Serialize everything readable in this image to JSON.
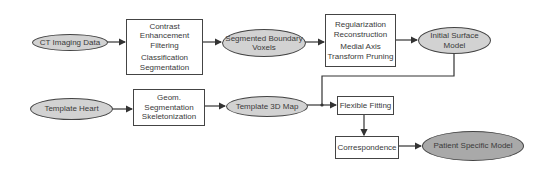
{
  "diagram": {
    "nodes": {
      "ct_imaging": {
        "label": "CT Imaging Data",
        "shape": "ellipse"
      },
      "preprocess": {
        "lines": [
          "Contrast",
          "Enhancement",
          "Filtering",
          "Classification",
          "Segmentation"
        ],
        "shape": "box"
      },
      "seg_voxels": {
        "lines": [
          "Segmented Boundary",
          "Voxels"
        ],
        "shape": "ellipse"
      },
      "reconstruct": {
        "lines": [
          "Regularization",
          "Reconstruction",
          "Medial Axis",
          "Transform Pruning"
        ],
        "shape": "box"
      },
      "initial_surface": {
        "lines": [
          "Initial Surface",
          "Model"
        ],
        "shape": "ellipse"
      },
      "template_heart": {
        "label": "Template Heart",
        "shape": "ellipse"
      },
      "geom": {
        "lines": [
          "Geom.",
          "Segmentation",
          "Skeletonization"
        ],
        "shape": "box"
      },
      "template_map": {
        "label": "Template 3D Map",
        "shape": "ellipse"
      },
      "flexible_fitting": {
        "label": "Flexible Fitting",
        "shape": "box"
      },
      "correspondence": {
        "label": "Correspondence",
        "shape": "box"
      },
      "patient_model": {
        "label": "Patient Specific Model",
        "shape": "ellipse-dark"
      }
    },
    "edges": [
      [
        "CT Imaging Data",
        "Contrast Enhancement Filtering / Classification Segmentation"
      ],
      [
        "Contrast Enhancement Filtering / Classification Segmentation",
        "Segmented Boundary Voxels"
      ],
      [
        "Segmented Boundary Voxels",
        "Regularization Reconstruction / Medial Axis Transform Pruning"
      ],
      [
        "Regularization Reconstruction / Medial Axis Transform Pruning",
        "Initial Surface Model"
      ],
      [
        "Initial Surface Model",
        "Flexible Fitting"
      ],
      [
        "Template Heart",
        "Geom. Segmentation Skeletonization"
      ],
      [
        "Geom. Segmentation Skeletonization",
        "Template 3D Map"
      ],
      [
        "Template 3D Map",
        "Flexible Fitting"
      ],
      [
        "Flexible Fitting",
        "Correspondence"
      ],
      [
        "Correspondence",
        "Patient Specific Model"
      ]
    ],
    "colors": {
      "ellipse_fill": "#d2d2d2",
      "ellipse_dark_fill": "#a9a9a9",
      "stroke": "#444444"
    }
  }
}
